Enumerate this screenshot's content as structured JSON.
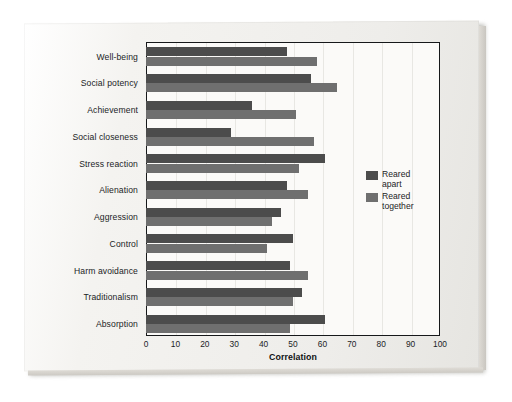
{
  "chart_data": {
    "type": "bar",
    "orientation": "horizontal",
    "title": "",
    "xlabel": "Correlation",
    "ylabel": "",
    "xlim": [
      0,
      100
    ],
    "xticks": [
      0,
      10,
      20,
      30,
      40,
      50,
      60,
      70,
      80,
      90,
      100
    ],
    "grid": true,
    "legend_position": "right",
    "categories": [
      "Well-being",
      "Social potency",
      "Achievement",
      "Social closeness",
      "Stress reaction",
      "Alienation",
      "Aggression",
      "Control",
      "Harm avoidance",
      "Traditionalism",
      "Absorption"
    ],
    "series": [
      {
        "name": "Reared apart",
        "color": "#4c4c4c",
        "values": [
          48,
          56,
          36,
          29,
          61,
          48,
          46,
          50,
          49,
          53,
          61
        ]
      },
      {
        "name": "Reared together",
        "color": "#6f6f6f",
        "values": [
          58,
          65,
          51,
          57,
          52,
          55,
          43,
          41,
          55,
          50,
          49
        ]
      }
    ]
  },
  "legend": {
    "items": [
      {
        "label": "Reared\napart",
        "color": "#4c4c4c"
      },
      {
        "label": "Reared\ntogether",
        "color": "#6f6f6f"
      }
    ]
  },
  "axis": {
    "x_title": "Correlation"
  }
}
